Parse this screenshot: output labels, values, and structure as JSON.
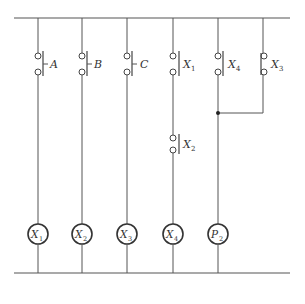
{
  "diagram": {
    "type": "ladder-logic",
    "rungs": [
      {
        "contacts": [
          {
            "label": "A",
            "sub": "",
            "type": "NO"
          }
        ],
        "coil": {
          "label": "X",
          "sub": "1"
        }
      },
      {
        "contacts": [
          {
            "label": "B",
            "sub": "",
            "type": "NO"
          }
        ],
        "coil": {
          "label": "X",
          "sub": "2"
        }
      },
      {
        "contacts": [
          {
            "label": "C",
            "sub": "",
            "type": "NO"
          }
        ],
        "coil": {
          "label": "X",
          "sub": "3"
        }
      },
      {
        "contacts": [
          {
            "label": "X",
            "sub": "1",
            "type": "NO"
          },
          {
            "label": "X",
            "sub": "2",
            "type": "NO"
          }
        ],
        "coil": {
          "label": "X",
          "sub": "4"
        }
      },
      {
        "contacts": [
          {
            "label": "X",
            "sub": "4",
            "type": "NO"
          }
        ],
        "parallel": {
          "label": "X",
          "sub": "3",
          "type": "NC"
        },
        "coil": {
          "label": "P",
          "sub": "2"
        }
      }
    ]
  },
  "labels": {
    "cA": "A",
    "cB": "B",
    "cC": "C",
    "cX1": "X",
    "cX1s": "1",
    "cX2": "X",
    "cX2s": "2",
    "cX4": "X",
    "cX4s": "4",
    "cX3": "X",
    "cX3s": "3",
    "k1": "X",
    "k1s": "1",
    "k2": "X",
    "k2s": "2",
    "k3": "X",
    "k3s": "3",
    "k4": "X",
    "k4s": "4",
    "k5": "P",
    "k5s": "2"
  }
}
